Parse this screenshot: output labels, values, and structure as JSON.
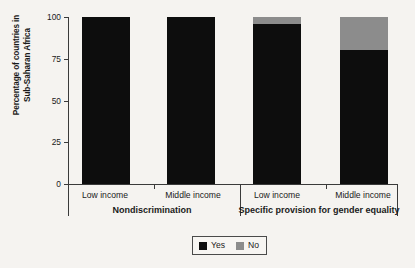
{
  "chart_data": {
    "type": "bar",
    "subtype": "stacked-bar",
    "title": "",
    "xlabel": "",
    "ylabel": "Percentage of countries in Sub-Saharan Africa",
    "ylabel_lines": [
      "Percentage of countries in",
      "Sub-Saharan Africa"
    ],
    "ylim": [
      0,
      100
    ],
    "yticks": [
      0,
      25,
      50,
      75,
      100
    ],
    "ytick_labels": [
      "0",
      "25",
      "50",
      "75",
      "100"
    ],
    "grid": false,
    "legend_position": "bottom-center",
    "groups": [
      {
        "name": "Nondiscrimination",
        "categories": [
          "Low income",
          "Middle income"
        ]
      },
      {
        "name": "Specific provision for gender equality",
        "categories": [
          "Low income",
          "Middle income"
        ]
      }
    ],
    "categories": [
      "Low income",
      "Middle income",
      "Low income",
      "Middle income"
    ],
    "series": [
      {
        "name": "Yes",
        "color": "#0d0d0d",
        "values": [
          100,
          100,
          96,
          80
        ]
      },
      {
        "name": "No",
        "color": "#8c8c8c",
        "values": [
          0,
          0,
          4,
          20
        ]
      }
    ],
    "bars": [
      {
        "group": "Nondiscrimination",
        "category": "Low income",
        "yes": 100,
        "no": 0
      },
      {
        "group": "Nondiscrimination",
        "category": "Middle income",
        "yes": 100,
        "no": 0
      },
      {
        "group": "Specific provision for gender equality",
        "category": "Low income",
        "yes": 96,
        "no": 4
      },
      {
        "group": "Specific provision for gender equality",
        "category": "Middle income",
        "yes": 80,
        "no": 20
      }
    ],
    "legend": [
      {
        "label": "Yes",
        "color": "#0d0d0d"
      },
      {
        "label": "No",
        "color": "#8c8c8c"
      }
    ]
  },
  "colors": {
    "background": "#f5f3f0",
    "axis": "#3a3a3a",
    "text": "#1a1a1a",
    "yes": "#0d0d0d",
    "no": "#8c8c8c"
  }
}
